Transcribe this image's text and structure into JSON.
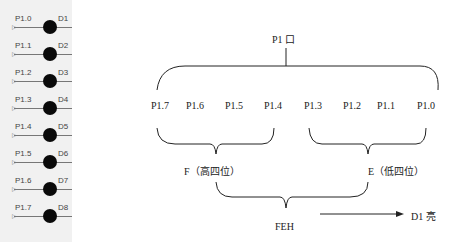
{
  "led_panel": {
    "rows": [
      {
        "pin": "P1.0",
        "led": "D1"
      },
      {
        "pin": "P1.1",
        "led": "D2"
      },
      {
        "pin": "P1.2",
        "led": "D3"
      },
      {
        "pin": "P1.3",
        "led": "D4"
      },
      {
        "pin": "P1.4",
        "led": "D5"
      },
      {
        "pin": "P1.5",
        "led": "D6"
      },
      {
        "pin": "P1.6",
        "led": "D7"
      },
      {
        "pin": "P1.7",
        "led": "D8"
      }
    ],
    "led_color": "#0a0a0a",
    "background": "#f1f1f1"
  },
  "diagram": {
    "port_label": "P1 口",
    "pins": [
      "P1.7",
      "P1.6",
      "P1.5",
      "P1.4",
      "P1.3",
      "P1.2",
      "P1.1",
      "P1.0"
    ],
    "high_nibble_label": "F（高四位）",
    "low_nibble_label": "E（低四位）",
    "combined_label": "FEH",
    "result_label": "D1 亮"
  }
}
